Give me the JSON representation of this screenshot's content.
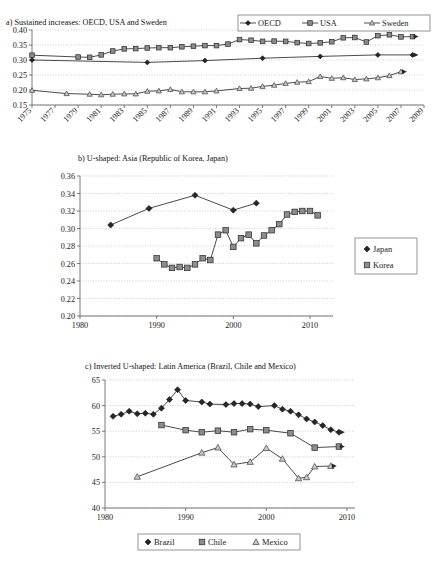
{
  "figure": {
    "panels": [
      "a",
      "b",
      "c"
    ]
  },
  "chart_data": [
    {
      "id": "panel-a",
      "type": "line",
      "title": "a) Sustained increases: OECD, USA and Sweden",
      "xlabel": "",
      "ylabel": "",
      "grid": true,
      "legend_position": "top-right",
      "xlim": [
        1975,
        2009
      ],
      "ylim": [
        0.15,
        0.4
      ],
      "yticks": [
        "0.15",
        "0.20",
        "0.25",
        "0.30",
        "0.35",
        "0.40"
      ],
      "ytick_values": [
        0.15,
        0.2,
        0.25,
        0.3,
        0.35,
        0.4
      ],
      "xticks": [
        "1975",
        "1977",
        "1979",
        "1981",
        "1983",
        "1985",
        "1987",
        "1989",
        "1991",
        "1993",
        "1995",
        "1997",
        "1999",
        "2001",
        "2003",
        "2005",
        "2007",
        "2009"
      ],
      "xtick_values": [
        1975,
        1977,
        1979,
        1981,
        1983,
        1985,
        1987,
        1989,
        1991,
        1993,
        1995,
        1997,
        1999,
        2001,
        2003,
        2005,
        2007,
        2009
      ],
      "series": [
        {
          "name": "OECD",
          "marker": "diamond",
          "x": [
            1975,
            1985,
            1990,
            1995,
            2000,
            2005,
            2008
          ],
          "values": [
            0.3,
            0.292,
            0.298,
            0.306,
            0.312,
            0.317,
            0.317
          ]
        },
        {
          "name": "USA",
          "marker": "square",
          "x": [
            1975,
            1979,
            1980,
            1981,
            1982,
            1983,
            1984,
            1985,
            1986,
            1987,
            1988,
            1989,
            1990,
            1991,
            1992,
            1993,
            1994,
            1995,
            1996,
            1997,
            1998,
            1999,
            2000,
            2001,
            2002,
            2003,
            2004,
            2005,
            2006,
            2007,
            2008
          ],
          "values": [
            0.316,
            0.31,
            0.309,
            0.317,
            0.33,
            0.337,
            0.338,
            0.34,
            0.341,
            0.341,
            0.344,
            0.346,
            0.348,
            0.348,
            0.353,
            0.368,
            0.366,
            0.362,
            0.363,
            0.362,
            0.358,
            0.355,
            0.357,
            0.361,
            0.374,
            0.375,
            0.36,
            0.381,
            0.384,
            0.377,
            0.378
          ]
        },
        {
          "name": "Sweden",
          "marker": "triangle",
          "x": [
            1975,
            1978,
            1980,
            1981,
            1982,
            1983,
            1984,
            1985,
            1986,
            1987,
            1988,
            1989,
            1990,
            1991,
            1993,
            1994,
            1995,
            1996,
            1997,
            1998,
            1999,
            2000,
            2001,
            2002,
            2003,
            2004,
            2005,
            2006,
            2007
          ],
          "values": [
            0.199,
            0.188,
            0.186,
            0.184,
            0.186,
            0.187,
            0.187,
            0.196,
            0.197,
            0.202,
            0.194,
            0.194,
            0.194,
            0.197,
            0.205,
            0.206,
            0.212,
            0.216,
            0.222,
            0.226,
            0.228,
            0.245,
            0.239,
            0.241,
            0.235,
            0.237,
            0.241,
            0.248,
            0.261
          ]
        }
      ]
    },
    {
      "id": "panel-b",
      "type": "line",
      "title": "b) U-shaped: Asia (Republic of Korea, Japan)",
      "xlabel": "",
      "ylabel": "",
      "grid": true,
      "legend_position": "right",
      "xlim": [
        1980,
        2013
      ],
      "ylim": [
        0.2,
        0.36
      ],
      "yticks": [
        "0.20",
        "0.22",
        "0.24",
        "0.26",
        "0.28",
        "0.30",
        "0.32",
        "0.34",
        "0.36"
      ],
      "ytick_values": [
        0.2,
        0.22,
        0.24,
        0.26,
        0.28,
        0.3,
        0.32,
        0.34,
        0.36
      ],
      "xticks": [
        "1980",
        "1990",
        "2000",
        "2010"
      ],
      "xtick_values": [
        1980,
        1990,
        2000,
        2010
      ],
      "series": [
        {
          "name": "Japan",
          "marker": "diamond",
          "x": [
            1984,
            1989,
            1995,
            2000,
            2003
          ],
          "values": [
            0.304,
            0.323,
            0.338,
            0.321,
            0.329
          ]
        },
        {
          "name": "Korea",
          "marker": "square",
          "x": [
            1990,
            1991,
            1992,
            1993,
            1994,
            1995,
            1996,
            1997,
            1998,
            1999,
            2000,
            2001,
            2002,
            2003,
            2004,
            2005,
            2006,
            2007,
            2008,
            2009,
            2010,
            2011
          ],
          "values": [
            0.266,
            0.259,
            0.255,
            0.256,
            0.255,
            0.259,
            0.266,
            0.264,
            0.293,
            0.298,
            0.279,
            0.289,
            0.293,
            0.283,
            0.292,
            0.298,
            0.305,
            0.316,
            0.319,
            0.32,
            0.32,
            0.315
          ]
        }
      ]
    },
    {
      "id": "panel-c",
      "type": "line",
      "title": "c) Inverted U-shaped: Latin America (Brazil, Chile and Mexico)",
      "xlabel": "",
      "ylabel": "",
      "grid": true,
      "legend_position": "bottom",
      "xlim": [
        1980,
        2011
      ],
      "ylim": [
        40,
        65
      ],
      "yticks": [
        "40",
        "45",
        "50",
        "55",
        "60",
        "65"
      ],
      "ytick_values": [
        40,
        45,
        50,
        55,
        60,
        65
      ],
      "xticks": [
        "1980",
        "1990",
        "2000",
        "2010"
      ],
      "xtick_values": [
        1980,
        1990,
        2000,
        2010
      ],
      "series": [
        {
          "name": "Brazil",
          "marker": "diamond",
          "x": [
            1981,
            1982,
            1983,
            1984,
            1985,
            1986,
            1987,
            1988,
            1989,
            1990,
            1992,
            1993,
            1995,
            1996,
            1997,
            1998,
            1999,
            2001,
            2002,
            2003,
            2004,
            2005,
            2006,
            2007,
            2008,
            2009
          ],
          "values": [
            57.9,
            58.3,
            58.9,
            58.4,
            58.5,
            58.3,
            59.5,
            61.2,
            63.1,
            61.0,
            60.7,
            60.3,
            60.2,
            60.4,
            60.4,
            60.3,
            59.8,
            60.0,
            59.3,
            58.9,
            58.2,
            57.4,
            56.8,
            56.1,
            55.3,
            54.8
          ]
        },
        {
          "name": "Chile",
          "marker": "square",
          "x": [
            1987,
            1990,
            1992,
            1994,
            1996,
            1998,
            2000,
            2003,
            2006,
            2009
          ],
          "values": [
            56.2,
            55.2,
            54.8,
            55.1,
            54.8,
            55.4,
            55.2,
            54.6,
            51.8,
            52.0
          ]
        },
        {
          "name": "Mexico",
          "marker": "triangle",
          "x": [
            1984,
            1992,
            1994,
            1996,
            1998,
            2000,
            2002,
            2004,
            2005,
            2006,
            2008
          ],
          "values": [
            46.1,
            50.8,
            51.8,
            48.5,
            49.0,
            51.7,
            49.6,
            45.8,
            46.0,
            48.1,
            48.2
          ]
        }
      ]
    }
  ]
}
